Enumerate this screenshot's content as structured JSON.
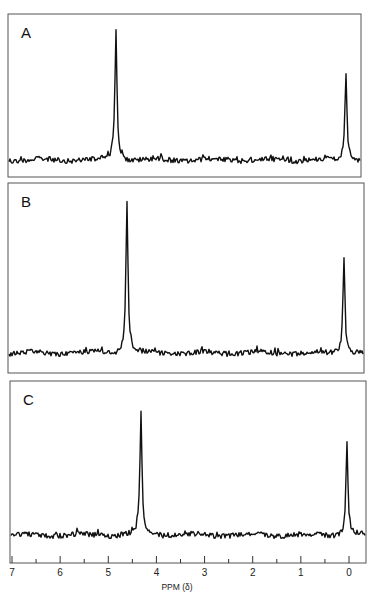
{
  "chart_data": [
    {
      "type": "line",
      "panel": "A",
      "title": "A",
      "xlabel": "PPM (δ)",
      "ylabel": "",
      "xlim": [
        7,
        -0.3
      ],
      "x_reversed": true,
      "peaks": [
        {
          "ppm": 4.83,
          "relative_height": 1.0,
          "label": "main peak"
        },
        {
          "ppm": 0.05,
          "relative_height": 0.65,
          "label": "TMS reference"
        }
      ],
      "baseline": "noisy"
    },
    {
      "type": "line",
      "panel": "B",
      "title": "B",
      "xlabel": "PPM (δ)",
      "ylabel": "",
      "xlim": [
        7,
        -0.3
      ],
      "x_reversed": true,
      "peaks": [
        {
          "ppm": 4.6,
          "relative_height": 1.0,
          "label": "main peak"
        },
        {
          "ppm": 0.1,
          "relative_height": 0.64,
          "label": "TMS reference"
        }
      ],
      "baseline": "noisy"
    },
    {
      "type": "line",
      "panel": "C",
      "title": "C",
      "xlabel": "PPM (δ)",
      "ylabel": "",
      "xlim": [
        7,
        -0.3
      ],
      "x_reversed": true,
      "peaks": [
        {
          "ppm": 4.3,
          "relative_height": 1.0,
          "label": "main peak"
        },
        {
          "ppm": 0.04,
          "relative_height": 0.76,
          "label": "TMS reference"
        }
      ],
      "baseline": "noisy"
    }
  ],
  "panels": [
    {
      "label": "A",
      "frame": {
        "x": 8,
        "y": 14,
        "w": 353,
        "h": 163
      },
      "baseline_y": 160,
      "peaks": [
        {
          "x": 116,
          "top": 27
        },
        {
          "x": 346,
          "top": 74
        }
      ]
    },
    {
      "label": "B",
      "frame": {
        "x": 8,
        "y": 183,
        "w": 356,
        "h": 190
      },
      "baseline_y": 353,
      "peaks": [
        {
          "x": 127,
          "top": 200
        },
        {
          "x": 344,
          "top": 256
        }
      ]
    },
    {
      "label": "C",
      "frame": {
        "x": 10,
        "y": 381,
        "w": 356,
        "h": 182
      },
      "baseline_y": 535,
      "peaks": [
        {
          "x": 141,
          "top": 414
        },
        {
          "x": 347,
          "top": 443
        }
      ]
    }
  ],
  "axis": {
    "title": "PPM (δ)",
    "baseline_y": 563,
    "x_at_7": 12,
    "x_at_0": 349,
    "major_ticks": [
      "7",
      "6",
      "5",
      "4",
      "3",
      "2",
      "1",
      "0"
    ],
    "minor_ticks": [
      6.5,
      5.5,
      4.5,
      3.5,
      2.5,
      1.5,
      0.5
    ]
  }
}
